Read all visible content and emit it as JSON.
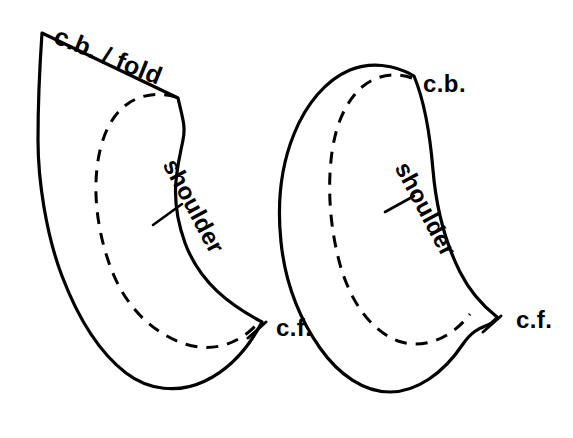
{
  "diagram": {
    "background_color": "#ffffff",
    "line_color": "#000000",
    "pieces": [
      {
        "id": "left-piece",
        "name": "left-pattern-piece",
        "labels": {
          "top_edge": "c.b. / fold",
          "side_edge": "shoulder",
          "front_point": "c.f."
        }
      },
      {
        "id": "right-piece",
        "name": "right-pattern-piece",
        "labels": {
          "top_edge": "c.b.",
          "side_edge": "shoulder",
          "front_point": "c.f."
        }
      }
    ],
    "legend": {
      "cut_line": "solid outline",
      "seam_line": "dashed inner line",
      "notch": "tick mark"
    }
  }
}
